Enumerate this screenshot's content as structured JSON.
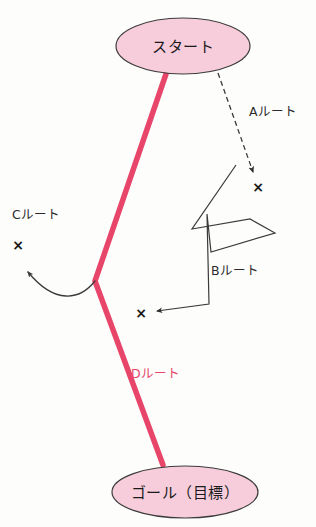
{
  "diagram": {
    "background_color": "#fdfdfc",
    "nodes": [
      {
        "id": "start",
        "label": "スタート",
        "shape": "ellipse",
        "cx": 183,
        "cy": 46,
        "rx": 67,
        "ry": 28,
        "fill": "#f7cddc",
        "stroke": "#3c3c3c"
      },
      {
        "id": "goal",
        "label": "ゴール（目標）",
        "shape": "ellipse",
        "cx": 185,
        "cy": 492,
        "rx": 73,
        "ry": 26,
        "fill": "#f7cddc",
        "stroke": "#3c3c3c"
      }
    ],
    "routes": [
      {
        "id": "route-a",
        "label": "Aルート",
        "style": "dashed",
        "color": "#3a3a3a",
        "label_x": 249,
        "label_y": 116,
        "end_marker": "x",
        "end_marker_x": 258,
        "end_marker_y": 192,
        "path": "M 218 73 L 253 172"
      },
      {
        "id": "route-b",
        "label": "Bルート",
        "style": "solid",
        "color": "#3a3a3a",
        "label_x": 211,
        "label_y": 275,
        "end_marker": "x",
        "end_marker_x": 141,
        "end_marker_y": 318,
        "path": "M 236 165 L 192 229 L 250 219 L 275 233 L 211 252 L 207 214 L 209 304 L 157 311"
      },
      {
        "id": "route-c",
        "label": "Cルート",
        "style": "curved",
        "color": "#3a3a3a",
        "label_x": 12,
        "label_y": 219,
        "end_marker": "x",
        "end_marker_x": 18,
        "end_marker_y": 250,
        "path": "M 95 281 C 80 300, 55 305, 28 272"
      },
      {
        "id": "route-d",
        "label": "Dルート",
        "style": "thick",
        "color": "#e8456a",
        "label_x": 131,
        "label_y": 378,
        "end_marker": "none",
        "path": "M 166 74 L 95 281 L 163 465"
      }
    ],
    "markers": {
      "x_glyph": "×"
    }
  }
}
